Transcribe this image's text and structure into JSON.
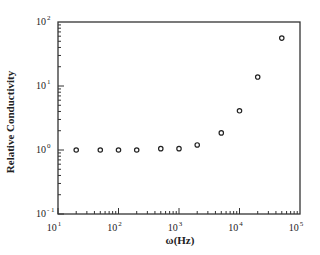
{
  "chart_data": {
    "type": "scatter",
    "title": "",
    "xlabel": "ω(Hz)",
    "ylabel": "Relative  Conductivity",
    "xscale": "log",
    "yscale": "log",
    "xlim": [
      10,
      100000
    ],
    "ylim": [
      0.1,
      100
    ],
    "grid": false,
    "legend": null,
    "x_ticks": [
      {
        "base": "10",
        "exp": "1",
        "value": 10
      },
      {
        "base": "10",
        "exp": "2",
        "value": 100
      },
      {
        "base": "10",
        "exp": "3",
        "value": 1000
      },
      {
        "base": "10",
        "exp": "4",
        "value": 10000
      },
      {
        "base": "10",
        "exp": "5",
        "value": 100000
      }
    ],
    "y_ticks": [
      {
        "base": "10",
        "exp": "- 1",
        "value": 0.1
      },
      {
        "base": "10",
        "exp": "0",
        "value": 1
      },
      {
        "base": "10",
        "exp": "1",
        "value": 10
      },
      {
        "base": "10",
        "exp": "2",
        "value": 100
      }
    ],
    "series": [
      {
        "name": "Relative Conductivity",
        "marker": "open-circle",
        "x": [
          20,
          50,
          100,
          200,
          500,
          1000,
          2000,
          5000,
          10000,
          20000,
          50000
        ],
        "y": [
          1.0,
          1.0,
          1.0,
          1.0,
          1.05,
          1.05,
          1.2,
          1.85,
          4.1,
          13.8,
          56
        ]
      }
    ]
  }
}
